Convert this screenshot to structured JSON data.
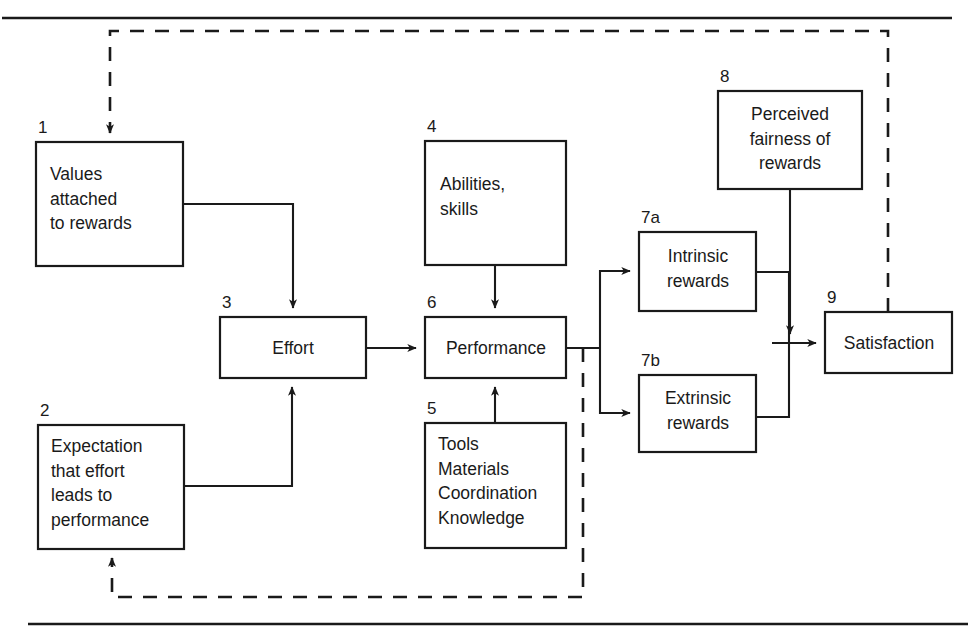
{
  "figure": {
    "kind": "flow-diagram",
    "background": "#ffffff",
    "line_color": "#1a1a1a",
    "top_rule": true,
    "bottom_rule": true
  },
  "boxes": [
    {
      "id": "values-attached-to-rewards",
      "number": "1",
      "lines": [
        "Values",
        "attached",
        "to rewards"
      ],
      "x": 36,
      "y": 142,
      "w": 147,
      "h": 124,
      "align": "start",
      "text_x": 50,
      "text_y": 180
    },
    {
      "id": "expectation-that-effort-leads-to-performance",
      "number": "2",
      "lines": [
        "Expectation",
        "that effort",
        "leads to",
        "performance"
      ],
      "x": 38,
      "y": 425,
      "w": 146,
      "h": 124,
      "align": "start",
      "text_x": 51,
      "text_y": 452
    },
    {
      "id": "effort",
      "number": "3",
      "lines": [
        "Effort"
      ],
      "x": 220,
      "y": 317,
      "w": 146,
      "h": 61,
      "align": "middle",
      "text_x": 293,
      "text_y": 354
    },
    {
      "id": "abilities-skills",
      "number": "4",
      "lines": [
        "Abilities,",
        "skills"
      ],
      "x": 425,
      "y": 141,
      "w": 141,
      "h": 124,
      "align": "start",
      "text_x": 440,
      "text_y": 190
    },
    {
      "id": "tools-materials-coordination-knowledge",
      "number": "5",
      "lines": [
        "Tools",
        "Materials",
        "Coordination",
        "Knowledge"
      ],
      "x": 425,
      "y": 423,
      "w": 141,
      "h": 125,
      "align": "start",
      "text_x": 438,
      "text_y": 450
    },
    {
      "id": "performance",
      "number": "6",
      "lines": [
        "Performance"
      ],
      "x": 425,
      "y": 317,
      "w": 141,
      "h": 61,
      "align": "middle",
      "text_x": 496,
      "text_y": 354
    },
    {
      "id": "intrinsic-rewards",
      "number": "7a",
      "lines": [
        "Intrinsic",
        "rewards"
      ],
      "x": 639,
      "y": 232,
      "w": 117,
      "h": 79,
      "align": "middle",
      "text_x": 698,
      "text_y": 262
    },
    {
      "id": "extrinsic-rewards",
      "number": "7b",
      "lines": [
        "Extrinsic",
        "rewards"
      ],
      "x": 639,
      "y": 375,
      "w": 117,
      "h": 77,
      "align": "middle",
      "text_x": 698,
      "text_y": 404
    },
    {
      "id": "perceived-fairness-of-rewards",
      "number": "8",
      "lines": [
        "Perceived",
        "fairness of",
        "rewards"
      ],
      "x": 718,
      "y": 91,
      "w": 144,
      "h": 98,
      "align": "middle",
      "text_x": 790,
      "text_y": 120
    },
    {
      "id": "satisfaction",
      "number": "9",
      "lines": [
        "Satisfaction"
      ],
      "x": 825,
      "y": 312,
      "w": 127,
      "h": 61,
      "align": "middle",
      "text_x": 889,
      "text_y": 349
    }
  ],
  "connectors": [
    {
      "id": "values-to-effort",
      "type": "solid",
      "arrow": true,
      "d": "M 183 204 L 293 204 L 293 308"
    },
    {
      "id": "expectation-to-effort",
      "type": "solid",
      "arrow": true,
      "d": "M 184 486 L 292 486 L 292 387"
    },
    {
      "id": "effort-to-performance",
      "type": "solid",
      "arrow": true,
      "d": "M 366 348 L 416 348"
    },
    {
      "id": "abilities-to-performance",
      "type": "solid",
      "arrow": true,
      "d": "M 495 265 L 495 308"
    },
    {
      "id": "tools-to-performance",
      "type": "solid",
      "arrow": true,
      "d": "M 495 423 L 495 387"
    },
    {
      "id": "performance-to-split",
      "type": "solid",
      "arrow": false,
      "d": "M 566 348 L 600 348"
    },
    {
      "id": "split-to-intrinsic",
      "type": "solid",
      "arrow": true,
      "d": "M 600 348 L 600 271 L 630 271"
    },
    {
      "id": "split-to-extrinsic",
      "type": "solid",
      "arrow": true,
      "d": "M 600 348 L 600 413 L 630 413"
    },
    {
      "id": "intrinsic-to-satisfaction",
      "type": "solid",
      "arrow": false,
      "d": "M 756 272 L 789 272 L 789 343"
    },
    {
      "id": "extrinsic-to-satisfaction",
      "type": "solid",
      "arrow": false,
      "d": "M 756 417 L 789 417 L 789 343"
    },
    {
      "id": "rewards-merge-to-satisfaction",
      "type": "solid",
      "arrow": true,
      "d": "M 772 343 L 816 343"
    },
    {
      "id": "fairness-to-satisfaction",
      "type": "solid",
      "arrow": true,
      "d": "M 790 189 L 790 334"
    },
    {
      "id": "satisfaction-feedback-to-values",
      "type": "dashed",
      "arrow": true,
      "d": "M 888 312 L 888 31 L 110 31 L 110 133"
    },
    {
      "id": "performance-feedback-to-expectation",
      "type": "dashed",
      "arrow": true,
      "d": "M 583 348 L 583 597 L 112 597 L 112 558"
    }
  ],
  "rules": [
    {
      "id": "top-rule",
      "x1": 2,
      "y1": 18,
      "x2": 952,
      "y2": 18
    },
    {
      "id": "bottom-rule",
      "x1": 28,
      "y1": 624,
      "x2": 968,
      "y2": 624
    }
  ]
}
